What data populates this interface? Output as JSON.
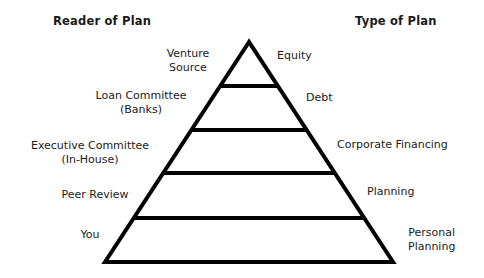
{
  "headers": {
    "left": "Reader of Plan",
    "right": "Type of Plan"
  },
  "levels": [
    {
      "reader": [
        "Venture",
        "Source"
      ],
      "plan": [
        "Equity"
      ]
    },
    {
      "reader": [
        "Loan Committee",
        "(Banks)"
      ],
      "plan": [
        "Debt"
      ]
    },
    {
      "reader": [
        "Executive Committee",
        "(In-House)"
      ],
      "plan": [
        "Corporate Financing"
      ]
    },
    {
      "reader": [
        "Peer Review"
      ],
      "plan": [
        "Planning"
      ]
    },
    {
      "reader": [
        "You"
      ],
      "plan": [
        "Personal",
        "Planning"
      ]
    }
  ],
  "colors": {
    "stroke": "#000000",
    "text": "#1a1a1a",
    "background": "#ffffff"
  }
}
